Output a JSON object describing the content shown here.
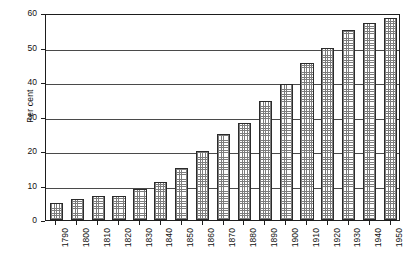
{
  "chart_data": {
    "type": "bar",
    "title": "",
    "xlabel": "",
    "ylabel": "Per cent",
    "ylim": [
      0,
      60
    ],
    "yticks": [
      0,
      10,
      20,
      30,
      40,
      50,
      60
    ],
    "grid": true,
    "legend": "none",
    "categories": [
      "1790",
      "1800",
      "1810",
      "1820",
      "1830",
      "1840",
      "1850",
      "1860",
      "1870",
      "1880",
      "1890",
      "1900",
      "1910",
      "1920",
      "1930",
      "1940",
      "1950"
    ],
    "values": [
      5,
      6,
      7,
      7,
      9,
      11,
      15,
      20,
      25,
      28,
      34.5,
      39.5,
      45.5,
      50,
      55,
      57,
      58.5
    ],
    "series": [
      {
        "name": "Per cent",
        "values": [
          5,
          6,
          7,
          7,
          9,
          11,
          15,
          20,
          25,
          28,
          34.5,
          39.5,
          45.5,
          50,
          55,
          57,
          58.5
        ]
      }
    ]
  },
  "axis": {
    "y_title": "Per cent",
    "y_tick_labels": [
      "60",
      "50",
      "40",
      "30",
      "20",
      "10",
      "0"
    ],
    "x_tick_labels": [
      "1790",
      "1800",
      "1810",
      "1820",
      "1830",
      "1840",
      "1850",
      "1860",
      "1870",
      "1880",
      "1890",
      "1900",
      "1910",
      "1920",
      "1930",
      "1940",
      "1950"
    ]
  },
  "style": {
    "bar_border_color": "#2b2b2b",
    "bar_fill_color": "#7d7d7d",
    "gridline_color": "#4a4a4a",
    "frame_color": "#1d1d1d",
    "background_color": "#ffffff"
  }
}
